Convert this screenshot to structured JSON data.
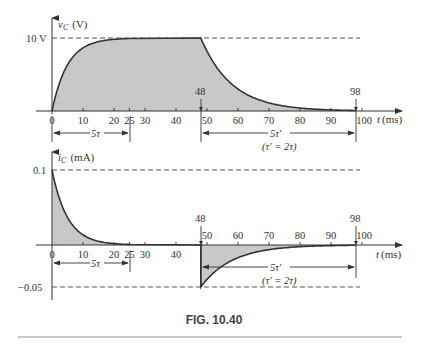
{
  "figure": {
    "caption": "FIG. 10.40"
  },
  "chart_data": [
    {
      "type": "area",
      "title": "",
      "ylabel": "v_C (V)",
      "ylabel_main": "v",
      "ylabel_sub": "C",
      "ylabel_unit": "(V)",
      "xlabel": "t (ms)",
      "xlabel_main": "t",
      "xlabel_unit": "(ms)",
      "ylim": [
        0,
        10
      ],
      "xlim": [
        0,
        100
      ],
      "y_reference_label": "10 V",
      "x_ticks": [
        0,
        10,
        20,
        25,
        30,
        40,
        50,
        60,
        70,
        80,
        90,
        100
      ],
      "x_tick_labels": [
        "0",
        "10",
        "20",
        "25",
        "30",
        "40",
        "50",
        "60",
        "70",
        "80",
        "90",
        "100"
      ],
      "markers": [
        {
          "x": 48,
          "label": "48"
        },
        {
          "x": 98,
          "label": "98"
        }
      ],
      "annotations": [
        {
          "from": 0,
          "to": 25,
          "label": "5τ"
        },
        {
          "from": 48,
          "to": 98,
          "label": "5τ′",
          "sublabel": "(τ′ = 2τ)"
        }
      ],
      "series": [
        {
          "name": "charging",
          "x": [
            0,
            5,
            10,
            15,
            20,
            25
          ],
          "values": [
            0,
            8.65,
            9.82,
            9.98,
            10,
            10
          ],
          "description": "10(1 - e^{-t/5ms})"
        },
        {
          "name": "steady",
          "x": [
            25,
            48
          ],
          "values": [
            10,
            10
          ]
        },
        {
          "name": "discharging",
          "x": [
            48,
            58,
            68,
            78,
            88,
            98
          ],
          "values": [
            10,
            3.68,
            1.35,
            0.5,
            0.18,
            0.07
          ],
          "description": "10 e^{-(t-48)/10ms}"
        }
      ]
    },
    {
      "type": "area",
      "title": "",
      "ylabel": "i_C (mA)",
      "ylabel_main": "i",
      "ylabel_sub": "C",
      "ylabel_unit": "(mA)",
      "xlabel": "t (ms)",
      "xlabel_main": "t",
      "xlabel_unit": "(ms)",
      "ylim": [
        -0.05,
        0.1
      ],
      "xlim": [
        0,
        100
      ],
      "y_reference_labels": [
        "0.1",
        "−0.05"
      ],
      "x_ticks": [
        0,
        10,
        20,
        25,
        30,
        40,
        50,
        60,
        70,
        80,
        90,
        100
      ],
      "x_tick_labels": [
        "0",
        "10",
        "20",
        "25",
        "30",
        "40",
        "50",
        "60",
        "70",
        "80",
        "90",
        "100"
      ],
      "markers": [
        {
          "x": 48,
          "label": "48"
        },
        {
          "x": 98,
          "label": "98"
        }
      ],
      "annotations": [
        {
          "from": 0,
          "to": 25,
          "label": "5τ"
        },
        {
          "from": 48,
          "to": 98,
          "label": "5τ′",
          "sublabel": "(τ′ = 2τ)"
        }
      ],
      "series": [
        {
          "name": "charging current",
          "x": [
            0,
            5,
            10,
            15,
            20,
            25
          ],
          "values": [
            0.1,
            0.0368,
            0.0135,
            0.005,
            0.0018,
            0.0007
          ],
          "description": "0.1 e^{-t/5ms}"
        },
        {
          "name": "zero",
          "x": [
            25,
            48
          ],
          "values": [
            0,
            0
          ]
        },
        {
          "name": "discharging current",
          "x": [
            48,
            58,
            68,
            78,
            88,
            98
          ],
          "values": [
            -0.05,
            -0.0184,
            -0.0068,
            -0.0025,
            -0.0009,
            -0.0003
          ],
          "description": "-0.05 e^{-(t-48)/10ms}"
        }
      ]
    }
  ]
}
